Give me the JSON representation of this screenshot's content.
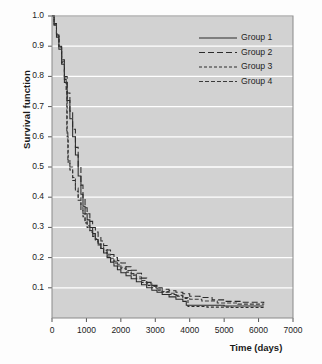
{
  "chart_data": {
    "type": "line",
    "title": "",
    "xlabel": "Time (days)",
    "ylabel": "Survival function",
    "xlim": [
      0,
      7000
    ],
    "ylim": [
      0.0,
      1.0
    ],
    "xticks": [
      0,
      1000,
      2000,
      3000,
      4000,
      5000,
      6000,
      7000
    ],
    "xtick_labels": [
      "0",
      "1000",
      "2000",
      "3000",
      "4000",
      "5000",
      "6000",
      "7000"
    ],
    "yticks": [
      0.1,
      0.2,
      0.3,
      0.4,
      0.5,
      0.6,
      0.7,
      0.8,
      0.9,
      1.0
    ],
    "ytick_labels": [
      "0.1",
      "0.2",
      "0.3",
      "0.4",
      "0.5",
      "0.6",
      "0.7",
      "0.8",
      "0.9",
      "1.0"
    ],
    "grid": "horizontal",
    "grid_color": "#ffffff",
    "plot_bgcolor": "#d2d2d2",
    "legend_position": "top-right",
    "series": [
      {
        "name": "Group 1",
        "dash": "solid",
        "color": "#2b2b2b",
        "points": [
          [
            0,
            1.0
          ],
          [
            60,
            0.97
          ],
          [
            130,
            0.93
          ],
          [
            200,
            0.89
          ],
          [
            280,
            0.84
          ],
          [
            360,
            0.78
          ],
          [
            440,
            0.72
          ],
          [
            520,
            0.66
          ],
          [
            600,
            0.6
          ],
          [
            680,
            0.54
          ],
          [
            760,
            0.47
          ],
          [
            840,
            0.41
          ],
          [
            900,
            0.37
          ],
          [
            960,
            0.345
          ],
          [
            1020,
            0.325
          ],
          [
            1100,
            0.3
          ],
          [
            1180,
            0.28
          ],
          [
            1260,
            0.26
          ],
          [
            1340,
            0.245
          ],
          [
            1420,
            0.23
          ],
          [
            1500,
            0.215
          ],
          [
            1600,
            0.2
          ],
          [
            1700,
            0.185
          ],
          [
            1800,
            0.172
          ],
          [
            1900,
            0.16
          ],
          [
            2000,
            0.15
          ],
          [
            2150,
            0.14
          ],
          [
            2300,
            0.13
          ],
          [
            2450,
            0.12
          ],
          [
            2600,
            0.11
          ],
          [
            2750,
            0.1
          ],
          [
            2900,
            0.092
          ],
          [
            3050,
            0.085
          ],
          [
            3200,
            0.078
          ],
          [
            3400,
            0.07
          ],
          [
            3600,
            0.062
          ],
          [
            3800,
            0.055
          ],
          [
            3900,
            0.042
          ],
          [
            4400,
            0.042
          ],
          [
            5000,
            0.04
          ],
          [
            5600,
            0.04
          ],
          [
            6150,
            0.04
          ]
        ]
      },
      {
        "name": "Group 2",
        "dash": "long-dash",
        "color": "#2b2b2b",
        "points": [
          [
            0,
            1.0
          ],
          [
            60,
            0.975
          ],
          [
            130,
            0.94
          ],
          [
            200,
            0.9
          ],
          [
            280,
            0.855
          ],
          [
            360,
            0.8
          ],
          [
            440,
            0.745
          ],
          [
            520,
            0.685
          ],
          [
            600,
            0.625
          ],
          [
            680,
            0.565
          ],
          [
            760,
            0.5
          ],
          [
            840,
            0.44
          ],
          [
            900,
            0.395
          ],
          [
            960,
            0.365
          ],
          [
            1020,
            0.345
          ],
          [
            1100,
            0.32
          ],
          [
            1180,
            0.3
          ],
          [
            1260,
            0.285
          ],
          [
            1340,
            0.27
          ],
          [
            1420,
            0.255
          ],
          [
            1500,
            0.24
          ],
          [
            1600,
            0.225
          ],
          [
            1700,
            0.21
          ],
          [
            1800,
            0.2
          ],
          [
            1900,
            0.19
          ],
          [
            2000,
            0.182
          ],
          [
            2150,
            0.17
          ],
          [
            2300,
            0.158
          ],
          [
            2450,
            0.148
          ],
          [
            2600,
            0.132
          ],
          [
            2750,
            0.118
          ],
          [
            2900,
            0.108
          ],
          [
            3050,
            0.1
          ],
          [
            3200,
            0.095
          ],
          [
            3400,
            0.09
          ],
          [
            3600,
            0.085
          ],
          [
            3800,
            0.08
          ],
          [
            4000,
            0.072
          ],
          [
            4300,
            0.068
          ],
          [
            4650,
            0.06
          ],
          [
            5000,
            0.055
          ],
          [
            5500,
            0.052
          ],
          [
            6150,
            0.05
          ]
        ]
      },
      {
        "name": "Group 3",
        "dash": "short-dash",
        "color": "#2b2b2b",
        "points": [
          [
            0,
            1.0
          ],
          [
            60,
            0.97
          ],
          [
            130,
            0.935
          ],
          [
            200,
            0.895
          ],
          [
            280,
            0.845
          ],
          [
            360,
            0.79
          ],
          [
            420,
            0.75
          ],
          [
            440,
            0.6
          ],
          [
            470,
            0.515
          ],
          [
            520,
            0.49
          ],
          [
            600,
            0.455
          ],
          [
            680,
            0.42
          ],
          [
            760,
            0.39
          ],
          [
            840,
            0.355
          ],
          [
            900,
            0.335
          ],
          [
            960,
            0.315
          ],
          [
            1020,
            0.3
          ],
          [
            1100,
            0.285
          ],
          [
            1180,
            0.27
          ],
          [
            1260,
            0.255
          ],
          [
            1340,
            0.242
          ],
          [
            1420,
            0.23
          ],
          [
            1500,
            0.218
          ],
          [
            1600,
            0.205
          ],
          [
            1700,
            0.193
          ],
          [
            1800,
            0.182
          ],
          [
            1900,
            0.172
          ],
          [
            2000,
            0.163
          ],
          [
            2150,
            0.152
          ],
          [
            2300,
            0.142
          ],
          [
            2450,
            0.13
          ],
          [
            2600,
            0.118
          ],
          [
            2750,
            0.108
          ],
          [
            2900,
            0.1
          ],
          [
            3050,
            0.092
          ],
          [
            3200,
            0.085
          ],
          [
            3400,
            0.078
          ],
          [
            3600,
            0.072
          ],
          [
            3800,
            0.065
          ],
          [
            3950,
            0.038
          ],
          [
            4500,
            0.036
          ],
          [
            5200,
            0.035
          ],
          [
            6150,
            0.035
          ]
        ]
      },
      {
        "name": "Group 4",
        "dash": "dash-dot",
        "color": "#3a3a3a",
        "points": [
          [
            0,
            1.0
          ],
          [
            60,
            0.972
          ],
          [
            130,
            0.938
          ],
          [
            200,
            0.898
          ],
          [
            280,
            0.85
          ],
          [
            360,
            0.795
          ],
          [
            410,
            0.755
          ],
          [
            430,
            0.62
          ],
          [
            460,
            0.525
          ],
          [
            520,
            0.5
          ],
          [
            600,
            0.465
          ],
          [
            680,
            0.43
          ],
          [
            760,
            0.4
          ],
          [
            840,
            0.365
          ],
          [
            900,
            0.345
          ],
          [
            960,
            0.322
          ],
          [
            1020,
            0.305
          ],
          [
            1100,
            0.29
          ],
          [
            1180,
            0.275
          ],
          [
            1260,
            0.262
          ],
          [
            1340,
            0.248
          ],
          [
            1420,
            0.236
          ],
          [
            1500,
            0.224
          ],
          [
            1600,
            0.211
          ],
          [
            1700,
            0.198
          ],
          [
            1800,
            0.188
          ],
          [
            1900,
            0.178
          ],
          [
            2000,
            0.168
          ],
          [
            2150,
            0.157
          ],
          [
            2300,
            0.147
          ],
          [
            2450,
            0.136
          ],
          [
            2600,
            0.124
          ],
          [
            2750,
            0.113
          ],
          [
            2900,
            0.104
          ],
          [
            3050,
            0.096
          ],
          [
            3200,
            0.088
          ],
          [
            3400,
            0.082
          ],
          [
            3600,
            0.075
          ],
          [
            3800,
            0.068
          ],
          [
            4000,
            0.062
          ],
          [
            4350,
            0.056
          ],
          [
            4800,
            0.05
          ],
          [
            5400,
            0.046
          ],
          [
            6150,
            0.045
          ]
        ]
      }
    ]
  },
  "legend": {
    "items": [
      {
        "label": "Group 1"
      },
      {
        "label": "Group 2"
      },
      {
        "label": "Group 3"
      },
      {
        "label": "Group 4"
      }
    ]
  },
  "axes": {
    "y_title": "Survival function",
    "x_title": "Time (days)"
  }
}
